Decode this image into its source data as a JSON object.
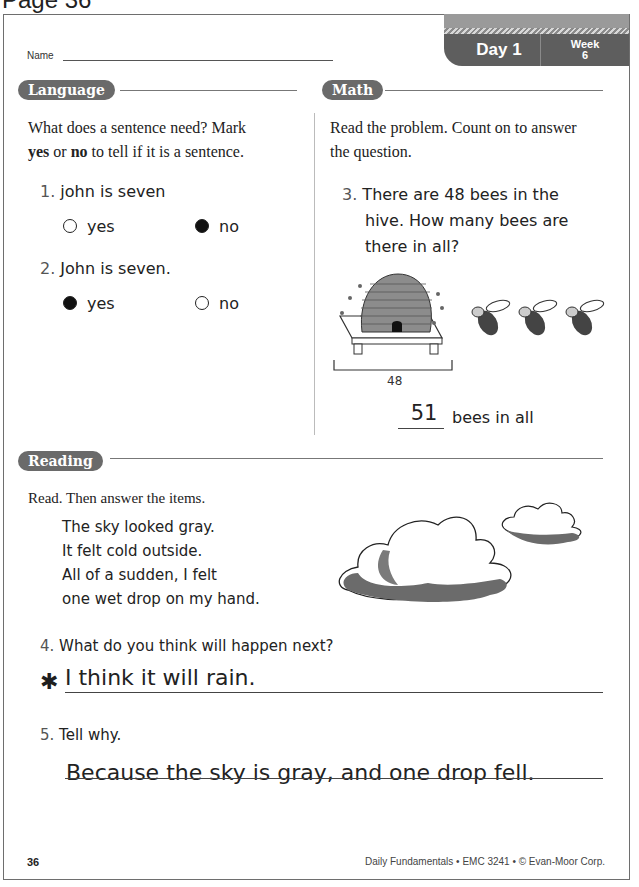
{
  "page_heading": "Page 36",
  "header": {
    "name_label": "Name",
    "day_label": "Day 1",
    "week_label": "Week",
    "week_number": "6"
  },
  "language": {
    "title": "Language",
    "instructions_parts": [
      "What does a sentence need? Mark",
      "yes",
      "or",
      "no",
      "to tell if it is a sentence."
    ],
    "items": [
      {
        "number": "1.",
        "text": "john is seven",
        "options": [
          {
            "label": "yes",
            "selected": false
          },
          {
            "label": "no",
            "selected": true
          }
        ]
      },
      {
        "number": "2.",
        "text": "John is seven.",
        "options": [
          {
            "label": "yes",
            "selected": true
          },
          {
            "label": "no",
            "selected": false
          }
        ]
      }
    ]
  },
  "math": {
    "title": "Math",
    "instructions": "Read the problem. Count on to answer the question.",
    "item": {
      "number": "3.",
      "lines": [
        "There are 48 bees in the",
        "hive. How many bees are",
        "there in all?"
      ],
      "bracket_label": "48",
      "extra_bees": 3,
      "answer": "51",
      "answer_suffix": "bees in all"
    }
  },
  "reading": {
    "title": "Reading",
    "instructions": "Read. Then answer the items.",
    "passage": [
      "The sky looked gray.",
      "It felt cold outside.",
      "All of a sudden, I felt",
      "one wet drop on my hand."
    ],
    "items": [
      {
        "number": "4.",
        "question": "What do you think will happen next?",
        "marker": "✱",
        "answer": "I think it will rain."
      },
      {
        "number": "5.",
        "question": "Tell why.",
        "answer": "Because the sky is gray, and one drop fell."
      }
    ]
  },
  "footer": {
    "page_number": "36",
    "credit": "Daily Fundamentals • EMC 3241 • © Evan-Moor Corp."
  }
}
